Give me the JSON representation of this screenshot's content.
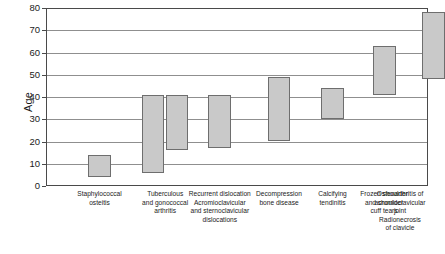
{
  "chart_data": {
    "type": "bar",
    "orientation": "vertical",
    "bar_style": "floating-range",
    "title": "",
    "xlabel": "",
    "ylabel": "Age",
    "ylim": [
      0,
      80
    ],
    "yticks": [
      0,
      10,
      20,
      30,
      40,
      50,
      60,
      70,
      80
    ],
    "ytick_labels": [
      "0",
      "10",
      "20",
      "30",
      "40",
      "50",
      "60",
      "70",
      "80"
    ],
    "grid": true,
    "grid_axis": "y",
    "legend": false,
    "legend_position": "none",
    "bar_fill_color": "#c9c9c9",
    "bar_edge_color": "#6e6e6e",
    "frame_color": "#4a4a4a",
    "gridline_color": "#8f8f8f",
    "categories": [
      "Staphylococcal osteitis",
      "Tuberculous and gonococcal arthritis",
      "Recurrent dislocation Acromioclavicular and sternoclavicular dislocations",
      "Decompression bone disease",
      "Calcifying tendinitis",
      "Frozen shoulder and shoulder cuff tears",
      "Osteoarthritis of acromioclavicular joint Radionecrosis of clavicle"
    ],
    "category_label_lines": [
      [
        "Staphylococcal",
        "osteitis"
      ],
      [
        "Tuberculous",
        "and gonococcal",
        "arthritis"
      ],
      [
        "Recurrent dislocation",
        "Acromioclavicular",
        "and sternoclavicular",
        "dislocations"
      ],
      [
        "Decompression",
        "bone disease"
      ],
      [
        "Calcifying",
        "tendinitis"
      ],
      [
        "Frozen shoulder",
        "and shoulder",
        "cuff tears"
      ],
      [
        "Osteoarthritis of",
        "acromioclavicular",
        "joint",
        "Radionecrosis",
        "of clavicle"
      ]
    ],
    "ranges": [
      {
        "category": "Staphylococcal osteitis",
        "low": 4,
        "high": 14
      },
      {
        "category": "Tuberculous and gonococcal arthritis",
        "low": 6,
        "high": 41
      },
      {
        "category": "Tuberculous and gonococcal arthritis",
        "low": 16,
        "high": 41
      },
      {
        "category": "Recurrent dislocation Acromioclavicular and sternoclavicular dislocations",
        "low": 17,
        "high": 41
      },
      {
        "category": "Decompression bone disease",
        "low": 20,
        "high": 49
      },
      {
        "category": "Calcifying tendinitis",
        "low": 30,
        "high": 44
      },
      {
        "category": "Frozen shoulder and shoulder cuff tears",
        "low": 41,
        "high": 63
      },
      {
        "category": "Osteoarthritis of acromioclavicular joint Radionecrosis of clavicle",
        "low": 48,
        "high": 78
      }
    ],
    "bars": [
      {
        "index": 0,
        "group": 0,
        "low": 4,
        "high": 14,
        "x_center_pct": 14.0,
        "width_pct": 6.0
      },
      {
        "index": 1,
        "group": 1,
        "low": 6,
        "high": 41,
        "x_center_pct": 28.0,
        "width_pct": 6.0
      },
      {
        "index": 2,
        "group": 1,
        "low": 16,
        "high": 41,
        "x_center_pct": 34.3,
        "width_pct": 6.0
      },
      {
        "index": 3,
        "group": 2,
        "low": 17,
        "high": 41,
        "x_center_pct": 45.5,
        "width_pct": 6.0
      },
      {
        "index": 4,
        "group": 3,
        "low": 20,
        "high": 49,
        "x_center_pct": 61.0,
        "width_pct": 6.0
      },
      {
        "index": 5,
        "group": 4,
        "low": 30,
        "high": 44,
        "x_center_pct": 75.0,
        "width_pct": 6.0
      },
      {
        "index": 6,
        "group": 5,
        "low": 41,
        "high": 63,
        "x_center_pct": 88.5,
        "width_pct": 6.0
      },
      {
        "index": 7,
        "group": 6,
        "low": 48,
        "high": 78,
        "x_center_pct": 101.5,
        "width_pct": 6.0
      }
    ]
  }
}
